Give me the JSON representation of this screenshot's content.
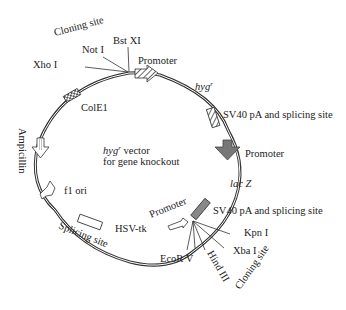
{
  "center_label": {
    "line1_gene": "hyg",
    "line1_sup": "r",
    "line1_rest": " vector",
    "line2": "for gene knockout"
  },
  "features": {
    "colE1": "ColE1",
    "ampicillin": "Ampicillin",
    "f1_ori": "f1 ori",
    "splicing_site": "Splicing site",
    "hsv_tk": "HSV-tk",
    "promoter_hsv": "Promoter",
    "promoter_top": "Promoter",
    "hygr_gene": "hyg",
    "hygr_sup": "r",
    "sv40_top": "SV40 pA and splicing site",
    "promoter_right": "Promoter",
    "lacz": "lac Z",
    "sv40_bottom": "SV40 pA and splicing site"
  },
  "cloning_site_top": {
    "label": "Cloning site",
    "enzymes": [
      "Xho I",
      "Not I",
      "Bst XI"
    ]
  },
  "cloning_site_bottom": {
    "label": "Cloning site",
    "enzymes": [
      "Kpn I",
      "Xba I",
      "Hind III",
      "EcoR V"
    ]
  },
  "colors": {
    "line": "#333333",
    "dark_arrow": "#777777",
    "lacz_box": "#888888"
  }
}
